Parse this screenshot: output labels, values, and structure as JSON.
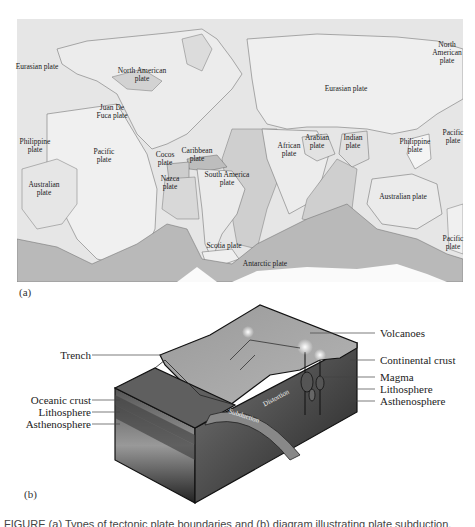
{
  "figure": {
    "panel_a": {
      "label": "(a)",
      "title": "World map of tectonic plates",
      "plates": {
        "eurasian_west": "Eurasian plate",
        "north_american": "North American plate",
        "juan_de_fuca": "Juan De Fuca plate",
        "philippine_west": "Philippine plate",
        "pacific_west": "Pacific plate",
        "cocos": "Cocos plate",
        "caribbean": "Caribbean plate",
        "australian_west": "Australian plate",
        "nazca": "Nazca plate",
        "south_america": "South America plate",
        "scotia": "Scotia plate",
        "antarctic": "Antarctic plate",
        "african": "African plate",
        "arabian": "Arabian plate",
        "indian": "Indian plate",
        "eurasian": "Eurasian plate",
        "north_american_east": "North American plate",
        "philippine_east": "Philippine plate",
        "pacific_east_upper": "Pacific plate",
        "australian_east": "Australian plate",
        "pacific_east_lower": "Pacific plate"
      }
    },
    "panel_b": {
      "label": "(b)",
      "left_labels": {
        "trench": "Trench",
        "oceanic_crust": "Oceanic crust",
        "lithosphere": "Lithosphere",
        "asthenosphere": "Asthenosphere"
      },
      "right_labels": {
        "volcanoes": "Volcanoes",
        "continental_crust": "Continental crust",
        "magma": "Magma",
        "lithosphere": "Lithosphere",
        "asthenosphere": "Asthenosphere"
      },
      "inline_labels": {
        "distortion": "Distortion",
        "subduction": "Subduction"
      }
    },
    "caption": "FIGURE (a) Types of tectonic plate boundaries and (b) diagram illustrating plate subduction."
  }
}
